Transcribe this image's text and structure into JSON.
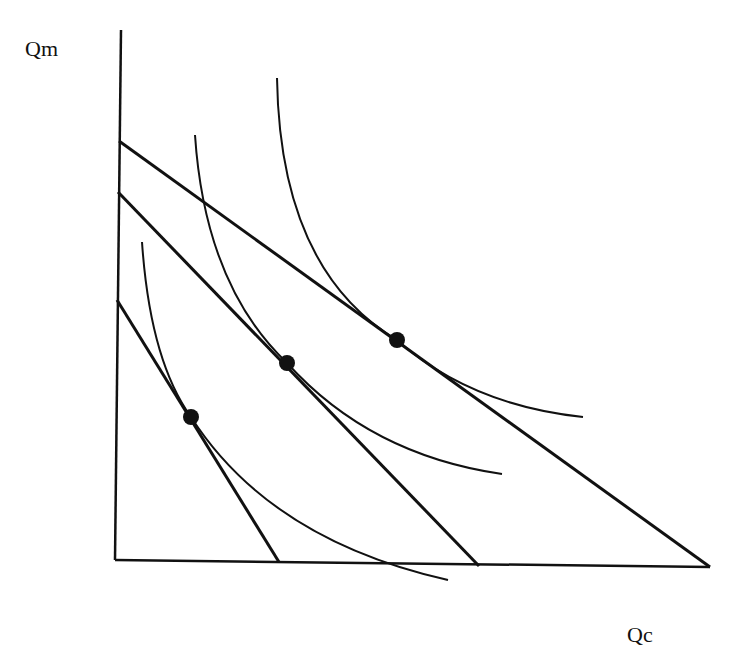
{
  "axes": {
    "y_label": "Qm",
    "x_label": "Qc"
  },
  "budget_lines": [
    {
      "name": "budget-line-1",
      "x1": 117,
      "y1": 300,
      "x2": 279,
      "y2": 562
    },
    {
      "name": "budget-line-2",
      "x1": 118,
      "y1": 192,
      "x2": 479,
      "y2": 566
    },
    {
      "name": "budget-line-3",
      "x1": 119,
      "y1": 141,
      "x2": 710,
      "y2": 567
    }
  ],
  "indifference_curves": [
    {
      "name": "indifference-curve-1",
      "path": "M142,242 Q150,360 191,417 Q270,540 448,580"
    },
    {
      "name": "indifference-curve-2",
      "path": "M195,135 Q205,285 287,363 Q370,455 502,474"
    },
    {
      "name": "indifference-curve-3",
      "path": "M277,78 Q280,270 397,340 Q470,405 583,417"
    }
  ],
  "tangency_points": [
    {
      "name": "tangency-point-1",
      "cx": 191,
      "cy": 417
    },
    {
      "name": "tangency-point-2",
      "cx": 287,
      "cy": 363
    },
    {
      "name": "tangency-point-3",
      "cx": 397,
      "cy": 340
    }
  ],
  "colors": {
    "stroke": "#111111",
    "background": "#ffffff"
  }
}
